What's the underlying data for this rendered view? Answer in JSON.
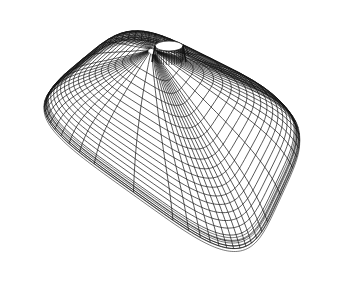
{
  "figure": {
    "width": 337,
    "height": 290,
    "background": "#ffffff",
    "line_color": "#111111",
    "line_width": 0.7
  },
  "mesh": {
    "rings": 20,
    "radials": 56,
    "apex": [
      169,
      58
    ],
    "hole": {
      "cx": 169,
      "cy": 46,
      "rx": 14,
      "ry": 5,
      "height": 14
    },
    "corners": {
      "top": [
        128,
        20
      ],
      "right": [
        316,
        112
      ],
      "bottom": [
        245,
        266
      ],
      "left": [
        22,
        106
      ]
    },
    "squareness": 4.2,
    "dome_lift": 30
  }
}
